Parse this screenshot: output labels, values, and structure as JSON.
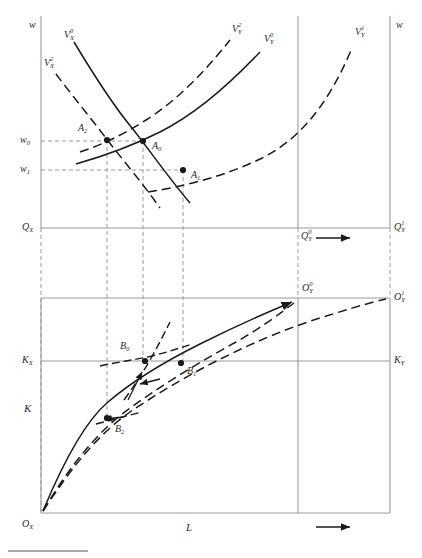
{
  "figure": {
    "type": "economics-diagram",
    "background_color": "#ffffff",
    "line_color": "#1a1a1a",
    "axis_color": "#8a8a8a",
    "guide_color": "#9a9a9a",
    "width": 422,
    "height": 558
  },
  "top_panel": {
    "axis_labels": {
      "left_w": "w",
      "right_w": "w",
      "q_x": "Q",
      "q_x_sub": "X",
      "q_y_0": "Q",
      "q_y_0_sub": "Y",
      "q_y_0_sup": "0",
      "q_y_1": "Q",
      "q_y_1_sub": "Y",
      "q_y_1_sup": "1"
    },
    "wage_ticks": [
      {
        "label": "w",
        "sub": "0",
        "y": 141
      },
      {
        "label": "w",
        "sub": "1",
        "y": 170
      }
    ],
    "curves": [
      {
        "name": "V_X_0",
        "base": "V",
        "sub": "X",
        "sup": "0",
        "style": "solid",
        "label_x": 64,
        "label_y": 36
      },
      {
        "name": "V_X_2",
        "base": "V",
        "sub": "X",
        "sup": "2",
        "style": "dashed",
        "label_x": 46,
        "label_y": 64
      },
      {
        "name": "V_Y_2",
        "base": "V",
        "sub": "Y",
        "sup": "2",
        "style": "dashed",
        "label_x": 233,
        "label_y": 30
      },
      {
        "name": "V_Y_0",
        "base": "V",
        "sub": "Y",
        "sup": "0",
        "style": "solid",
        "label_x": 265,
        "label_y": 40
      },
      {
        "name": "V_Y_1",
        "base": "V",
        "sub": "Y",
        "sup": "1",
        "style": "dashed",
        "label_x": 355,
        "label_y": 33
      }
    ],
    "equilibria": [
      {
        "name": "A",
        "sub": "0",
        "x": 143,
        "y": 141,
        "label_x": 152,
        "label_y": 146
      },
      {
        "name": "A",
        "sub": "1",
        "x": 183,
        "y": 170,
        "label_x": 192,
        "label_y": 176
      },
      {
        "name": "A",
        "sub": "2",
        "x": 107,
        "y": 140,
        "label_x": 80,
        "label_y": 128
      }
    ],
    "shift_arrow": {
      "from_x": 316,
      "to_x": 352,
      "y": 238,
      "direction": "right"
    }
  },
  "bottom_panel": {
    "axis_labels": {
      "k_axis": "K",
      "l_axis": "L",
      "k_x": "K",
      "k_x_sub": "X",
      "k_y": "K",
      "k_y_sub": "Y",
      "o_x": "O",
      "o_x_sub": "X",
      "o_y_0": "O",
      "o_y_0_sub": "Y",
      "o_y_0_sup": "0",
      "o_y_1": "O",
      "o_y_1_sub": "Y",
      "o_y_1_sup": "1"
    },
    "allocations": [
      {
        "name": "B",
        "sub": "0",
        "x": 145,
        "y": 361,
        "label_x": 122,
        "label_y": 348
      },
      {
        "name": "B",
        "sub": "1",
        "x": 181,
        "y": 363,
        "label_x": 188,
        "label_y": 372
      },
      {
        "name": "B",
        "sub": "2",
        "x": 107,
        "y": 418,
        "label_x": 116,
        "label_y": 430
      }
    ],
    "expansion_arrow": {
      "from_x": 316,
      "to_x": 352,
      "y": 527,
      "direction": "right"
    }
  },
  "geometry": {
    "left_axis_x": 41,
    "inner_axis_x": 298,
    "right_axis_x": 390,
    "top_panel_top_y": 16,
    "q_axis_y": 228,
    "bottom_panel_top_y": 298,
    "k_axis_y": 361,
    "bottom_axis_y": 513,
    "guide_x_positions": [
      107,
      143,
      183
    ],
    "far_guides": [
      298,
      390
    ]
  }
}
